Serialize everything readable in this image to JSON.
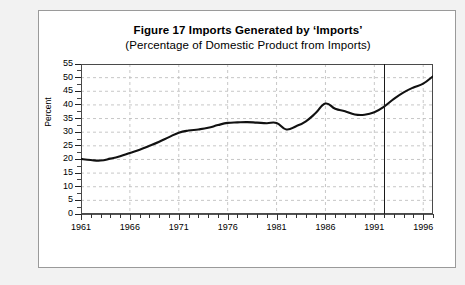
{
  "figure": {
    "title_main": "Figure 17  Imports Generated by ‘Imports’",
    "title_sub": "(Percentage of Domestic Product from Imports)"
  },
  "chart_data": {
    "type": "line",
    "title": "Figure 17  Imports Generated by ‘Imports’",
    "subtitle": "(Percentage of Domestic Product from Imports)",
    "xlabel": "",
    "ylabel": "Percent",
    "xlim": [
      1961,
      1997
    ],
    "ylim": [
      0,
      55
    ],
    "yticks": [
      0,
      5,
      10,
      15,
      20,
      25,
      30,
      35,
      40,
      45,
      50,
      55
    ],
    "ytick_labels": [
      "0",
      "5",
      "10",
      "15",
      "20",
      "25",
      "30",
      "35",
      "40",
      "45",
      "50",
      "55"
    ],
    "xticks": [
      1961,
      1966,
      1971,
      1976,
      1981,
      1986,
      1991,
      1996
    ],
    "xtick_labels": [
      "1961",
      "1966",
      "1971",
      "1976",
      "1981",
      "1986",
      "1991",
      "1996"
    ],
    "xminor_interval": 1,
    "grid": true,
    "grid_style": "dashed",
    "legend": null,
    "annotations": [
      {
        "type": "vertical-line",
        "x": 1992,
        "label": ""
      }
    ],
    "x": [
      1961,
      1962,
      1963,
      1964,
      1965,
      1966,
      1967,
      1968,
      1969,
      1970,
      1971,
      1972,
      1973,
      1974,
      1975,
      1976,
      1977,
      1978,
      1979,
      1980,
      1981,
      1982,
      1983,
      1984,
      1985,
      1986,
      1987,
      1988,
      1989,
      1990,
      1991,
      1992,
      1993,
      1994,
      1995,
      1996,
      1997
    ],
    "values": [
      20.2,
      19.8,
      19.6,
      20.3,
      21.2,
      22.4,
      23.6,
      25.0,
      26.5,
      28.2,
      29.8,
      30.6,
      31.0,
      31.6,
      32.6,
      33.4,
      33.6,
      33.7,
      33.5,
      33.3,
      33.4,
      31.0,
      32.2,
      34.0,
      37.0,
      40.5,
      38.6,
      37.7,
      36.5,
      36.4,
      37.3,
      39.4,
      42.2,
      44.6,
      46.4,
      47.8,
      50.5
    ],
    "series": [
      {
        "name": "Percentage of Domestic Product from Imports",
        "color": "#111111",
        "values": [
          20.2,
          19.8,
          19.6,
          20.3,
          21.2,
          22.4,
          23.6,
          25.0,
          26.5,
          28.2,
          29.8,
          30.6,
          31.0,
          31.6,
          32.6,
          33.4,
          33.6,
          33.7,
          33.5,
          33.3,
          33.4,
          31.0,
          32.2,
          34.0,
          37.0,
          40.5,
          38.6,
          37.7,
          36.5,
          36.4,
          37.3,
          39.4,
          42.2,
          44.6,
          46.4,
          47.8,
          50.5
        ]
      }
    ]
  }
}
